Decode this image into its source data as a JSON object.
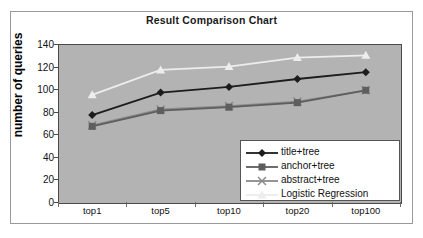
{
  "chart_data": {
    "type": "line",
    "title": "Result Comparison Chart",
    "xlabel": "",
    "ylabel": "number of queries",
    "categories": [
      "top1",
      "top5",
      "top10",
      "top20",
      "top100"
    ],
    "ylim": [
      0,
      140
    ],
    "yticks": [
      0,
      20,
      40,
      60,
      80,
      100,
      120,
      140
    ],
    "grid": false,
    "legend_position": "inside-bottom-right",
    "plot_background": "#b3b3b3",
    "series": [
      {
        "name": "title+tree",
        "values": [
          77,
          97,
          102,
          109,
          115
        ],
        "color": "#1c1c1c",
        "marker": "diamond"
      },
      {
        "name": "anchor+tree",
        "values": [
          67,
          81,
          84,
          88,
          99
        ],
        "color": "#5e5e5e",
        "marker": "square"
      },
      {
        "name": "abstract+tree",
        "values": [
          68,
          82,
          85,
          89,
          99
        ],
        "color": "#8a8a8a",
        "marker": "x"
      },
      {
        "name": "Logistic Regression",
        "values": [
          95,
          117,
          120,
          128,
          130
        ],
        "color": "#ededed",
        "marker": "triangle"
      }
    ]
  },
  "legend": {
    "entries": [
      {
        "label": "title+tree"
      },
      {
        "label": "anchor+tree"
      },
      {
        "label": "abstract+tree"
      },
      {
        "label": "Logistic Regression"
      }
    ]
  }
}
